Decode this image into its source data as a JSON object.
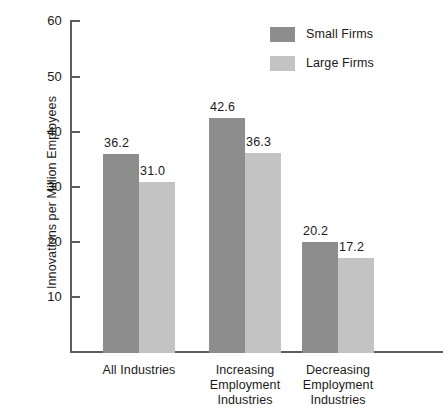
{
  "chart_data": {
    "type": "bar",
    "title": "",
    "xlabel": "",
    "ylabel": "Innovations per Million Employees",
    "categories": [
      "All Industries",
      "Increasing Employment Industries",
      "Decreasing Employment Industries"
    ],
    "category_lines": [
      [
        "All Industries"
      ],
      [
        "Increasing",
        "Employment",
        "Industries"
      ],
      [
        "Decreasing",
        "Employment",
        "Industries"
      ]
    ],
    "series": [
      {
        "name": "Small Firms",
        "color": "#8d8d8d",
        "values": [
          36.2,
          42.6,
          20.2
        ],
        "value_labels": [
          "36.2",
          "42.6",
          "20.2"
        ]
      },
      {
        "name": "Large Firms",
        "color": "#c3c3c3",
        "values": [
          31.0,
          36.3,
          17.2
        ],
        "value_labels": [
          "31.0",
          "36.3",
          "17.2"
        ]
      }
    ],
    "ylim": [
      0,
      60
    ],
    "yticks": [
      10,
      20,
      30,
      40,
      50,
      60
    ],
    "ytick_labels": [
      "10",
      "20",
      "30",
      "40",
      "50",
      "60"
    ],
    "grid": false,
    "legend_position": "top-right",
    "legend": [
      {
        "label": "Small Firms",
        "color": "#8d8d8d"
      },
      {
        "label": "Large Firms",
        "color": "#c3c3c3"
      }
    ]
  }
}
